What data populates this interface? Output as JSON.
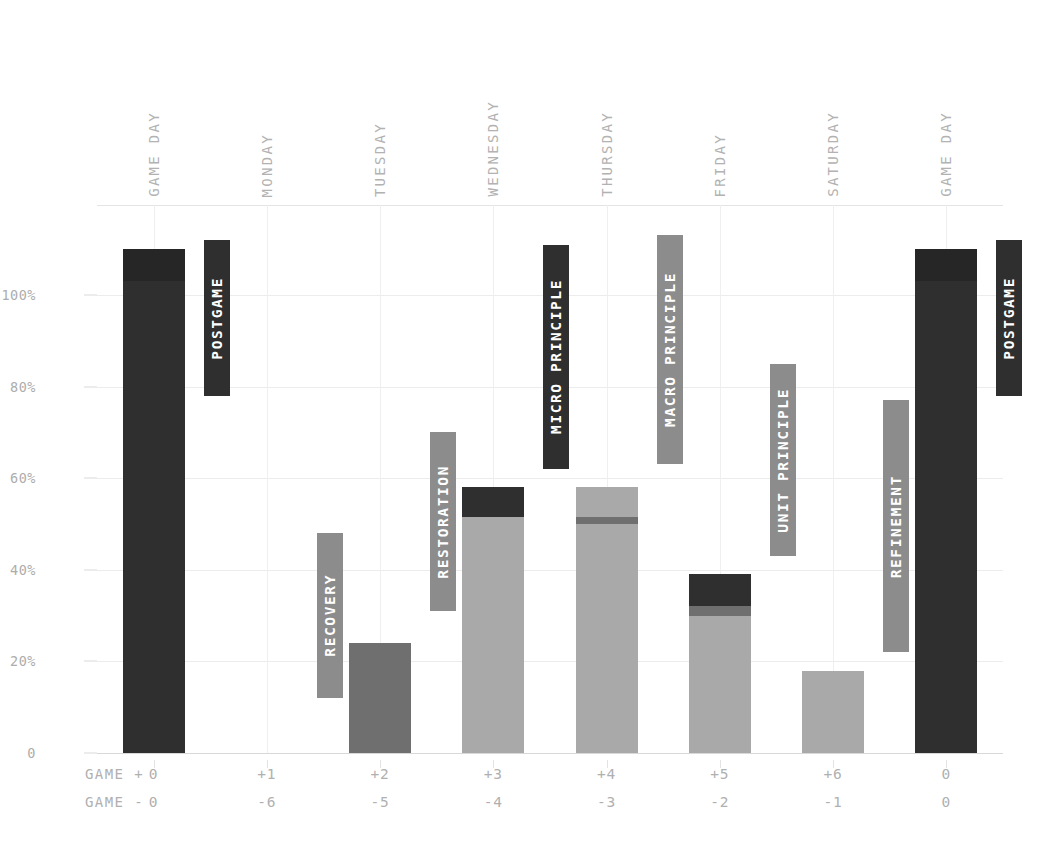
{
  "chart_data": {
    "type": "bar",
    "title": "",
    "subtitle": "",
    "xlabel": "",
    "ylabel": "",
    "ylim": [
      0,
      120
    ],
    "yticks": [
      0,
      20,
      40,
      60,
      80,
      100
    ],
    "ytick_labels": [
      "0",
      "20%",
      "40%",
      "60%",
      "80%",
      "100%"
    ],
    "grid": true,
    "legend_position": "none",
    "stacked": true,
    "categories": [
      "GAME DAY",
      "MONDAY",
      "TUESDAY",
      "WEDNESDAY",
      "THURSDAY",
      "FRIDAY",
      "SATURDAY",
      "GAME DAY"
    ],
    "axis_rows": [
      {
        "label": "GAME +",
        "values": [
          "0",
          "+1",
          "+2",
          "+3",
          "+4",
          "+5",
          "+6",
          "0"
        ]
      },
      {
        "label": "GAME -",
        "values": [
          "0",
          "-6",
          "-5",
          "-4",
          "-3",
          "-2",
          "-1",
          "0"
        ]
      }
    ],
    "series": [
      {
        "name": "base-load",
        "color": "#a9a9a9",
        "values": [
          0,
          0,
          0,
          51.5,
          50,
          30,
          18,
          0
        ]
      },
      {
        "name": "mid-load",
        "color": "#6f6f6f",
        "values": [
          0,
          0,
          24,
          0,
          1.5,
          2,
          0,
          0
        ]
      },
      {
        "name": "upper-load",
        "color": "#a9a9a9",
        "values": [
          0,
          0,
          0,
          0,
          6.5,
          0,
          0,
          0
        ]
      },
      {
        "name": "peak-load",
        "color": "#2f2f2f",
        "values": [
          103,
          0,
          0,
          6.5,
          0,
          7,
          0,
          103
        ]
      },
      {
        "name": "cap-load",
        "color": "#262626",
        "values": [
          7,
          0,
          0,
          0,
          0,
          0,
          0,
          7
        ]
      }
    ],
    "bar_totals": [
      110,
      0,
      24,
      58,
      58,
      39,
      18,
      110
    ],
    "badges": [
      {
        "category": "GAME DAY",
        "label": "POSTGAME",
        "color": "#2f2f2f",
        "text_color": "#ffffff",
        "from": 78,
        "to": 112
      },
      {
        "category": "MONDAY",
        "label": "RECOVERY",
        "color": "#8c8c8c",
        "text_color": "#ffffff",
        "from": 12,
        "to": 48
      },
      {
        "category": "TUESDAY",
        "label": "RESTORATION",
        "color": "#8c8c8c",
        "text_color": "#ffffff",
        "from": 31,
        "to": 70
      },
      {
        "category": "WEDNESDAY",
        "label": "MICRO PRINCIPLE",
        "color": "#2f2f2f",
        "text_color": "#ffffff",
        "from": 62,
        "to": 111
      },
      {
        "category": "THURSDAY",
        "label": "MACRO PRINCIPLE",
        "color": "#8c8c8c",
        "text_color": "#ffffff",
        "from": 63,
        "to": 113
      },
      {
        "category": "FRIDAY",
        "label": "UNIT PRINCIPLE",
        "color": "#8c8c8c",
        "text_color": "#ffffff",
        "from": 43,
        "to": 85
      },
      {
        "category": "SATURDAY",
        "label": "REFINEMENT",
        "color": "#8c8c8c",
        "text_color": "#ffffff",
        "from": 22,
        "to": 77
      },
      {
        "category": "GAME DAY",
        "label": "POSTGAME",
        "color": "#2f2f2f",
        "text_color": "#ffffff",
        "from": 78,
        "to": 112
      }
    ],
    "colors": {
      "dark": "#2f2f2f",
      "medium": "#6f6f6f",
      "light": "#a9a9a9",
      "badge_gray": "#8c8c8c",
      "grid": "#ececec",
      "axis_text": "#b0b0b0",
      "background": "#ffffff"
    }
  }
}
